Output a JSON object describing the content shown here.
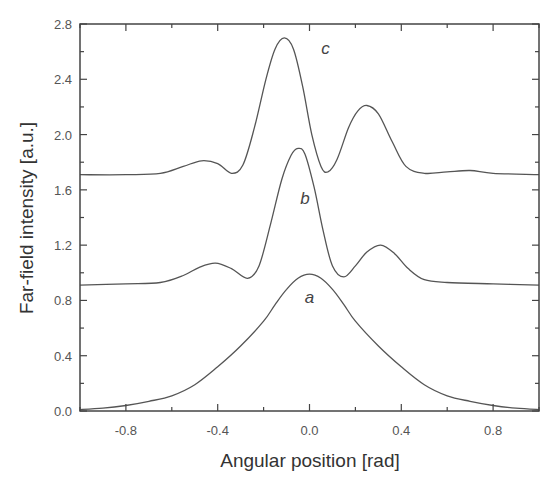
{
  "chart_data": {
    "type": "line",
    "title": "",
    "xlabel": "Angular position [rad]",
    "ylabel": "Far-field intensity [a.u.]",
    "xlim": [
      -1.0,
      1.0
    ],
    "ylim": [
      0.0,
      2.8
    ],
    "grid": false,
    "legend": "none (curves labeled inline a, b, c)",
    "x_ticks": [
      -0.8,
      -0.4,
      0.0,
      0.4,
      0.8
    ],
    "x_tick_labels": [
      "-0.8",
      "-0.4",
      "0.0",
      "0.4",
      "0.8"
    ],
    "y_ticks": [
      0.0,
      0.4,
      0.8,
      1.2,
      1.6,
      2.0,
      2.4,
      2.8
    ],
    "y_tick_labels": [
      "0.0",
      "0.4",
      "0.8",
      "1.2",
      "1.6",
      "2.0",
      "2.4",
      "2.8"
    ],
    "series": [
      {
        "name": "a",
        "label_pos": [
          0.0,
          0.78
        ],
        "x": [
          -1.0,
          -0.9,
          -0.8,
          -0.7,
          -0.6,
          -0.5,
          -0.4,
          -0.3,
          -0.2,
          -0.15,
          -0.1,
          -0.05,
          0.0,
          0.05,
          0.1,
          0.15,
          0.2,
          0.3,
          0.4,
          0.5,
          0.6,
          0.7,
          0.8,
          0.9,
          1.0
        ],
        "y": [
          0.01,
          0.02,
          0.04,
          0.07,
          0.11,
          0.19,
          0.32,
          0.47,
          0.65,
          0.77,
          0.88,
          0.96,
          0.99,
          0.96,
          0.88,
          0.77,
          0.65,
          0.47,
          0.32,
          0.19,
          0.11,
          0.07,
          0.04,
          0.02,
          0.01
        ]
      },
      {
        "name": "b",
        "label_pos": [
          -0.02,
          1.5
        ],
        "x": [
          -1.0,
          -0.8,
          -0.65,
          -0.55,
          -0.48,
          -0.41,
          -0.34,
          -0.27,
          -0.22,
          -0.17,
          -0.12,
          -0.08,
          -0.05,
          -0.02,
          0.02,
          0.06,
          0.1,
          0.15,
          0.2,
          0.25,
          0.31,
          0.37,
          0.43,
          0.5,
          0.6,
          0.8,
          1.0
        ],
        "y": [
          0.91,
          0.92,
          0.93,
          0.98,
          1.04,
          1.07,
          1.03,
          0.96,
          1.05,
          1.35,
          1.68,
          1.85,
          1.9,
          1.86,
          1.62,
          1.3,
          1.05,
          0.97,
          1.05,
          1.15,
          1.2,
          1.14,
          1.03,
          0.95,
          0.93,
          0.92,
          0.91
        ]
      },
      {
        "name": "c",
        "label_pos": [
          0.07,
          2.58
        ],
        "x": [
          -1.0,
          -0.8,
          -0.65,
          -0.55,
          -0.47,
          -0.4,
          -0.34,
          -0.29,
          -0.24,
          -0.19,
          -0.15,
          -0.11,
          -0.07,
          -0.03,
          0.01,
          0.05,
          0.08,
          0.12,
          0.17,
          0.21,
          0.25,
          0.3,
          0.36,
          0.42,
          0.5,
          0.6,
          0.7,
          0.8,
          1.0
        ],
        "y": [
          1.71,
          1.71,
          1.72,
          1.77,
          1.81,
          1.79,
          1.72,
          1.78,
          2.05,
          2.4,
          2.62,
          2.7,
          2.62,
          2.35,
          2.0,
          1.77,
          1.73,
          1.82,
          2.05,
          2.17,
          2.21,
          2.15,
          1.95,
          1.77,
          1.72,
          1.73,
          1.74,
          1.72,
          1.71
        ]
      }
    ]
  }
}
